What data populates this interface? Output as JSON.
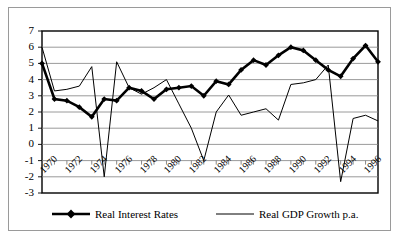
{
  "chart_data": {
    "type": "line",
    "title": "",
    "xlabel": "",
    "ylabel": "",
    "ylim": [
      -3,
      7
    ],
    "xlim": [
      1970,
      1997
    ],
    "grid": true,
    "grid_axis": "y",
    "legend_position": "bottom",
    "ytick_labels": [
      "7",
      "6",
      "5",
      "4",
      "3",
      "2",
      "1",
      "0",
      "-1",
      "-2",
      "-3"
    ],
    "yticks": [
      7,
      6,
      5,
      4,
      3,
      2,
      1,
      0,
      -1,
      -2,
      -3
    ],
    "xtick_labels": [
      "1970",
      "1972",
      "1974",
      "1976",
      "1978",
      "1980",
      "1982",
      "1984",
      "1986",
      "1988",
      "1990",
      "1992",
      "1994",
      "1996"
    ],
    "xticks": [
      1970,
      1972,
      1974,
      1976,
      1978,
      1980,
      1982,
      1984,
      1986,
      1988,
      1990,
      1992,
      1994,
      1996
    ],
    "x": [
      1970,
      1971,
      1972,
      1973,
      1974,
      1975,
      1976,
      1977,
      1978,
      1979,
      1980,
      1981,
      1982,
      1983,
      1984,
      1985,
      1986,
      1987,
      1988,
      1989,
      1990,
      1991,
      1992,
      1993,
      1994,
      1995,
      1996,
      1997
    ],
    "series": [
      {
        "name": "Real Interest Rates",
        "marker": "diamond",
        "line_width": "thick",
        "color": "#000000",
        "values": [
          5.0,
          2.8,
          2.7,
          2.3,
          1.7,
          2.8,
          2.7,
          3.5,
          3.3,
          2.8,
          3.4,
          3.5,
          3.6,
          3.0,
          3.9,
          3.7,
          4.6,
          5.2,
          4.9,
          5.5,
          6.0,
          5.8,
          5.2,
          4.6,
          4.2,
          5.3,
          6.1,
          5.1
        ]
      },
      {
        "name": "Real GDP Growth p.a.",
        "marker": "none",
        "line_width": "thin",
        "color": "#000000",
        "values": [
          6.0,
          3.3,
          3.4,
          3.6,
          4.8,
          -2.0,
          5.1,
          3.5,
          3.1,
          3.5,
          4.0,
          2.5,
          1.0,
          -1.0,
          2.0,
          3.05,
          1.8,
          2.0,
          2.2,
          1.5,
          3.7,
          3.8,
          4.0,
          4.9,
          -2.3,
          1.6,
          1.8,
          1.45
        ]
      }
    ],
    "series2_tail": {
      "note_x": [
        1990,
        1991,
        1992,
        1993,
        1994,
        1995,
        1996,
        1997
      ],
      "values": [
        3.8,
        4.0,
        4.9,
        -2.3,
        1.6,
        1.8,
        1.45,
        2.2
      ]
    }
  },
  "legend": {
    "items": [
      {
        "label": "Real Interest Rates",
        "marker": "diamond"
      },
      {
        "label": "Real GDP Growth p.a.",
        "marker": "line"
      }
    ]
  }
}
